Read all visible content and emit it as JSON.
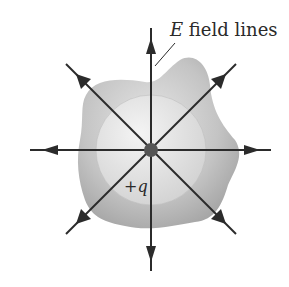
{
  "diagram": {
    "label_field_lines_var": "E",
    "label_field_lines_text": " field lines",
    "charge_label": "+q",
    "colors": {
      "line": "#2b2b2b",
      "blob_outer": "#b5b5b5",
      "blob_inner": "#e2e2e2",
      "charge_dot": "#555555"
    }
  }
}
